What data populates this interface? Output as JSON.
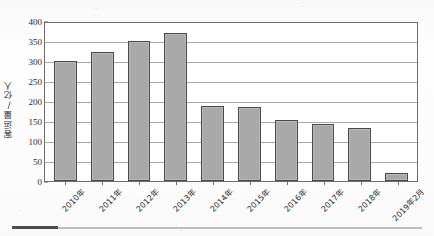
{
  "chart_data": {
    "type": "bar",
    "title": "",
    "subtitle": "",
    "xlabel": "",
    "ylabel": "客运量/亿人",
    "ylim": [
      0,
      400
    ],
    "yticks": [
      400,
      350,
      300,
      250,
      200,
      150,
      100,
      50,
      0
    ],
    "grid": true,
    "legend": null,
    "categories": [
      "2010年",
      "2011年",
      "2012年",
      "2013年",
      "2014年",
      "2015年",
      "2016年",
      "2017年",
      "2018年",
      "2019年2月"
    ],
    "values": [
      300,
      323,
      350,
      369,
      187,
      186,
      152,
      142,
      133,
      20
    ],
    "series": [
      {
        "name": "客运量",
        "values": [
          300,
          323,
          350,
          369,
          187,
          186,
          152,
          142,
          133,
          20
        ]
      }
    ],
    "bar_fill_color": "#a9a9a9",
    "bar_edge_color": "#4a4a4a",
    "gridline_color": "#9a9a9a",
    "axis_color": "#6d6d6d"
  },
  "figure": {
    "footer_rule_color": "#bdbdbd",
    "footer_rule_accent_color": "#4d4d4d"
  }
}
